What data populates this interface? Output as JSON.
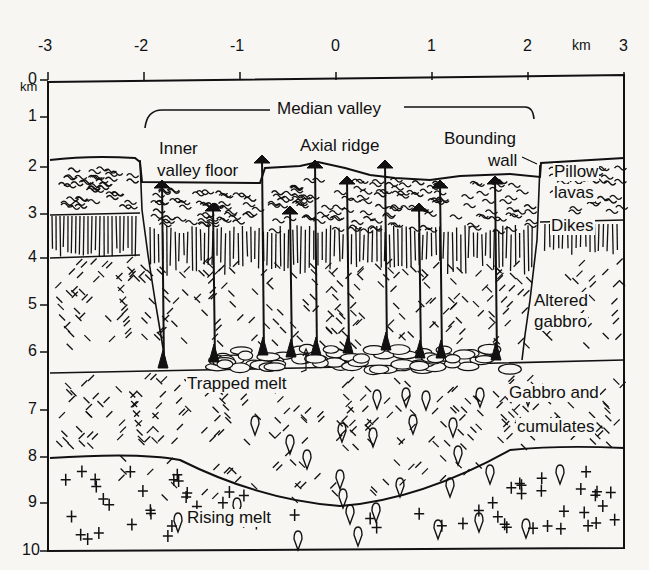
{
  "figure": {
    "type": "geologic-cross-section"
  },
  "axes": {
    "x": {
      "unit": "km",
      "ticks": [
        "-3",
        "-2",
        "-1",
        "0",
        "1",
        "2",
        "3"
      ],
      "range": [
        -3,
        3
      ]
    },
    "y": {
      "unit": "km",
      "ticks": [
        "0",
        "1",
        "2",
        "3",
        "4",
        "5",
        "6",
        "7",
        "8",
        "9",
        "10"
      ],
      "range": [
        0,
        10
      ]
    }
  },
  "labels": {
    "median_valley": "Median valley",
    "inner_valley_floor_1": "Inner",
    "inner_valley_floor_2": "valley floor",
    "axial_ridge": "Axial ridge",
    "bounding_wall_1": "Bounding",
    "bounding_wall_2": "wall",
    "pillow_lavas_1": "Pillow",
    "pillow_lavas_2": "lavas",
    "dikes": "Dikes",
    "altered_gabbro_1": "Altered",
    "altered_gabbro_2": "gabbro",
    "trapped_melt": "Trapped melt",
    "gabbro_cumulates_1": "Gabbro and",
    "gabbro_cumulates_2": "cumulates",
    "rising_melt": "Rising melt"
  },
  "layers": [
    {
      "name": "Pillow lavas",
      "depth_km": "2-3"
    },
    {
      "name": "Dikes",
      "depth_km": "3-4"
    },
    {
      "name": "Altered gabbro",
      "depth_km": "4-6"
    },
    {
      "name": "Trapped melt",
      "depth_km": "~6"
    },
    {
      "name": "Gabbro and cumulates",
      "depth_km": "6.3-8"
    },
    {
      "name": "Rising melt",
      "depth_km": "8-10"
    }
  ]
}
